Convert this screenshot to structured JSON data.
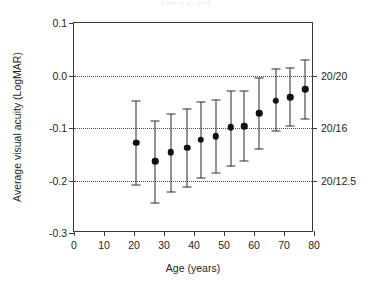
{
  "chart_data": {
    "type": "scatter",
    "title": "Elliott et al., 1995",
    "xlabel": "Age (years)",
    "ylabel": "Average visual acuity (LogMAR)",
    "xlim": [
      0,
      80
    ],
    "ylim": [
      -0.3,
      0.1
    ],
    "grid": true,
    "legend": null,
    "x_ticks": [
      0,
      10,
      20,
      30,
      40,
      50,
      60,
      70,
      80
    ],
    "x_tick_labels": [
      "0",
      "10",
      "20",
      "30",
      "40",
      "50",
      "60",
      "70",
      "80"
    ],
    "y_ticks": [
      0.1,
      0.0,
      -0.1,
      -0.2,
      -0.3
    ],
    "y_tick_labels": [
      "0.1",
      "0.0",
      "-0.1",
      "-0.2",
      "-0.3"
    ],
    "secondary_axis": {
      "label": "Snellen acuity",
      "ticks": [
        0.0,
        -0.1,
        -0.2
      ],
      "tick_labels": [
        "20/20",
        "20/16",
        "20/12.5"
      ]
    },
    "gridlines_at": [
      0.0,
      -0.1,
      -0.2
    ],
    "series": [
      {
        "name": "Average visual acuity",
        "marker": "filled-circle",
        "errorbars": "vertical",
        "x": [
          20.7,
          27.0,
          32.3,
          37.7,
          42.3,
          47.3,
          52.3,
          56.7,
          61.7,
          67.3,
          72.0,
          77.0
        ],
        "y": [
          -0.128,
          -0.163,
          -0.146,
          -0.138,
          -0.122,
          -0.116,
          -0.099,
          -0.097,
          -0.072,
          -0.048,
          -0.041,
          -0.026
        ],
        "y_low": [
          -0.208,
          -0.243,
          -0.222,
          -0.213,
          -0.196,
          -0.185,
          -0.172,
          -0.163,
          -0.14,
          -0.105,
          -0.096,
          -0.082
        ],
        "y_high": [
          -0.048,
          -0.086,
          -0.073,
          -0.064,
          -0.05,
          -0.047,
          -0.029,
          -0.03,
          -0.005,
          0.012,
          0.015,
          0.03
        ]
      }
    ]
  }
}
